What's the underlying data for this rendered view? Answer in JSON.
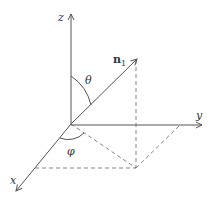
{
  "diagram": {
    "type": "spherical-coordinates",
    "colors": {
      "stroke": "#555555",
      "text": "#333333",
      "background": "#ffffff"
    },
    "labels": {
      "z_axis": "z",
      "y_axis": "y",
      "x_axis": "x",
      "vector": "n",
      "vector_subscript": "1",
      "theta": "θ",
      "phi": "φ"
    }
  }
}
